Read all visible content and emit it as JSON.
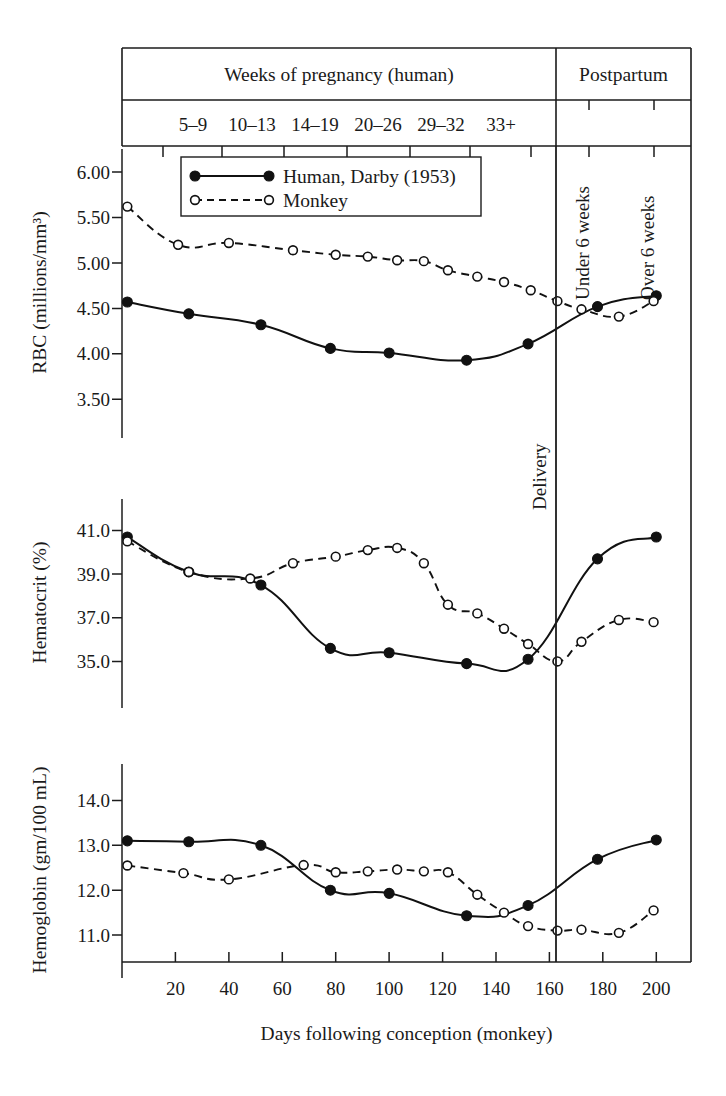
{
  "figure": {
    "title_header": "Weeks of pregnancy (human)",
    "postpartum_header": "Postpartum",
    "week_bands": [
      "5–9",
      "10–13",
      "14–19",
      "20–26",
      "29–32",
      "33+"
    ],
    "postpartum_bands": [
      "Under 6 weeks",
      "Over 6 weeks"
    ],
    "delivery_label": "Delivery",
    "xlabel": "Days following conception (monkey)",
    "x_ticks": [
      20,
      40,
      60,
      80,
      100,
      120,
      140,
      160,
      180,
      200
    ],
    "x_tick_labels": [
      "20",
      "40",
      "60",
      "80",
      "100",
      "120",
      "140",
      "160",
      "180",
      "200"
    ],
    "xlim": [
      0,
      213
    ],
    "delivery_day": 168
  },
  "legend": {
    "position": "top-left inside RBC panel",
    "entries": [
      {
        "label": "Human, Darby (1953)",
        "marker": "filled-circle",
        "line": "solid"
      },
      {
        "label": "Monkey",
        "marker": "open-circle",
        "line": "dashed"
      }
    ]
  },
  "chart_data": [
    {
      "type": "line",
      "title": "RBC",
      "ylabel": "RBC (millions/mm³)",
      "xlabel": "Days following conception (monkey)",
      "ylim": [
        3.25,
        6.1
      ],
      "y_ticks": [
        3.5,
        4.0,
        4.5,
        5.0,
        5.5,
        6.0
      ],
      "y_tick_labels": [
        "3.50",
        "4.00",
        "4.50",
        "5.00",
        "5.50",
        "6.00"
      ],
      "grid": false,
      "legend": [
        "Human, Darby (1953)",
        "Monkey"
      ],
      "series": [
        {
          "name": "Human, Darby (1953)",
          "marker": "filled-circle",
          "line": "solid",
          "x": [
            2,
            25,
            52,
            78,
            100,
            129,
            152,
            178,
            200
          ],
          "values": [
            4.57,
            4.44,
            4.32,
            4.06,
            4.01,
            3.93,
            4.11,
            4.52,
            4.64
          ]
        },
        {
          "name": "Monkey",
          "marker": "open-circle",
          "line": "dashed",
          "x": [
            2,
            21,
            40,
            64,
            80,
            92,
            103,
            113,
            122,
            133,
            143,
            153,
            163,
            172,
            186,
            199
          ],
          "values": [
            5.62,
            5.2,
            5.22,
            5.14,
            5.09,
            5.07,
            5.03,
            5.02,
            4.92,
            4.85,
            4.79,
            4.7,
            4.58,
            4.49,
            4.41,
            4.58
          ]
        }
      ]
    },
    {
      "type": "line",
      "title": "Hematocrit",
      "ylabel": "Hematocrit (%)",
      "xlabel": "Days following conception (monkey)",
      "ylim": [
        33.6,
        41.8
      ],
      "y_ticks": [
        35.0,
        37.0,
        39.0,
        41.0
      ],
      "y_tick_labels": [
        "35.0",
        "37.0",
        "39.0",
        "41.0"
      ],
      "grid": false,
      "legend": [
        "Human, Darby (1953)",
        "Monkey"
      ],
      "series": [
        {
          "name": "Human, Darby (1953)",
          "marker": "filled-circle",
          "line": "solid",
          "x": [
            2,
            25,
            52,
            78,
            100,
            129,
            152,
            178,
            200
          ],
          "values": [
            40.7,
            39.1,
            38.5,
            35.6,
            35.4,
            34.9,
            35.1,
            39.7,
            40.7
          ]
        },
        {
          "name": "Monkey",
          "marker": "open-circle",
          "line": "dashed",
          "x": [
            2,
            25,
            48,
            64,
            80,
            92,
            103,
            113,
            122,
            133,
            143,
            152,
            163,
            172,
            186,
            199
          ],
          "values": [
            40.5,
            39.1,
            38.8,
            39.5,
            39.8,
            40.1,
            40.2,
            39.5,
            37.6,
            37.2,
            36.5,
            35.8,
            35.0,
            35.9,
            36.9,
            36.8
          ]
        }
      ]
    },
    {
      "type": "line",
      "title": "Hemoglobin",
      "ylabel": "Hemoglobin (gm/100 mL)",
      "xlabel": "Days following conception (monkey)",
      "ylim": [
        10.4,
        14.5
      ],
      "y_ticks": [
        11.0,
        12.0,
        13.0,
        14.0
      ],
      "y_tick_labels": [
        "11.0",
        "12.0",
        "13.0",
        "14.0"
      ],
      "grid": false,
      "legend": [
        "Human, Darby (1953)",
        "Monkey"
      ],
      "series": [
        {
          "name": "Human, Darby (1953)",
          "marker": "filled-circle",
          "line": "solid",
          "x": [
            2,
            25,
            52,
            78,
            100,
            129,
            152,
            178,
            200
          ],
          "values": [
            13.1,
            13.08,
            13.0,
            12.0,
            11.93,
            11.43,
            11.66,
            12.69,
            13.12
          ]
        },
        {
          "name": "Monkey",
          "marker": "open-circle",
          "line": "dashed",
          "x": [
            2,
            23,
            40,
            68,
            80,
            92,
            103,
            113,
            122,
            133,
            143,
            152,
            163,
            172,
            186,
            199
          ],
          "values": [
            12.55,
            12.38,
            12.24,
            12.56,
            12.4,
            12.42,
            12.46,
            12.42,
            12.4,
            11.9,
            11.5,
            11.2,
            11.1,
            11.12,
            11.05,
            11.55
          ]
        }
      ]
    }
  ]
}
